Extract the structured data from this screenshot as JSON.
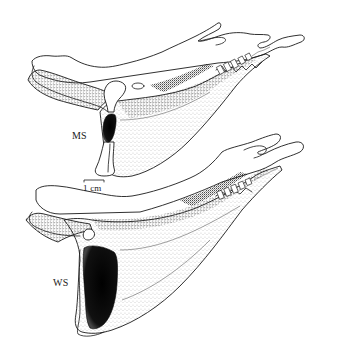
{
  "figure": {
    "specimens": [
      {
        "id": "upper",
        "label": "MS"
      },
      {
        "id": "lower",
        "label": "WS"
      }
    ],
    "scale_bar": {
      "label": "1 cm"
    },
    "colors": {
      "ink": "#1a1a1a",
      "background": "#ffffff",
      "stipple": "#333333",
      "fossa_fill": "#0a0a0a"
    }
  }
}
